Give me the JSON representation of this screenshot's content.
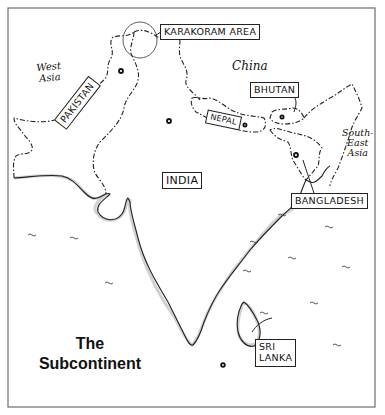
{
  "map": {
    "title_line1": "The",
    "title_line2": "Subcontinent",
    "countries": {
      "india": "INDIA",
      "pakistan": "PAKISTAN",
      "nepal": "NEPAL",
      "bhutan": "BHUTAN",
      "bangladesh": "BANGLADESH",
      "sri_lanka_line1": "SRI",
      "sri_lanka_line2": "LANKA",
      "karakoram": "KARAKORAM AREA"
    },
    "regions": {
      "west_asia_line1": "West",
      "west_asia_line2": "Asia",
      "china": "China",
      "southeast_asia_line1": "South-",
      "southeast_asia_line2": "East",
      "southeast_asia_line3": "Asia"
    },
    "colors": {
      "ink": "#222222",
      "frame": "#6e6e6e",
      "background": "#ffffff"
    }
  }
}
